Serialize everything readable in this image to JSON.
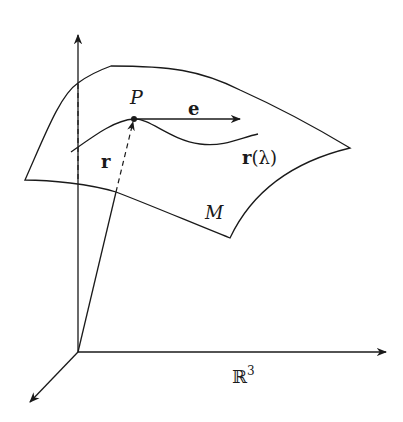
{
  "diagram": {
    "type": "manifold-tangent-vector",
    "labels": {
      "point": "P",
      "tangent_vector": "e",
      "curve": "r(λ)",
      "curve_bold": "r",
      "curve_paren": "(λ)",
      "position_vector": "r",
      "manifold": "M",
      "ambient_space": "ℝ",
      "ambient_exponent": "3"
    },
    "colors": {
      "stroke": "#1a1a1a",
      "background": "#ffffff"
    }
  }
}
